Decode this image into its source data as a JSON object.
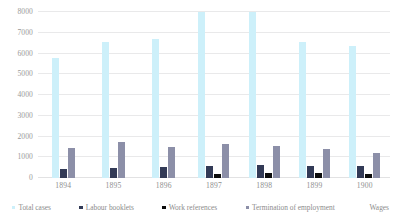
{
  "chart_data": {
    "type": "bar",
    "title": "",
    "subtitle": "",
    "xlabel": "",
    "ylabel": "",
    "ylim": [
      0,
      8000
    ],
    "ytick_step": 1000,
    "grid": true,
    "legend_position": "bottom",
    "categories": [
      "1894",
      "1895",
      "1896",
      "1897",
      "1898",
      "1899",
      "1900"
    ],
    "yticks": [
      "0",
      "1000",
      "2000",
      "3000",
      "4000",
      "5000",
      "6000",
      "7000",
      "8000"
    ],
    "series": [
      {
        "name": "Total cases",
        "color": "#cdf0fa",
        "values": [
          5800,
          6550,
          6700,
          8000,
          8000,
          6550,
          6350
        ]
      },
      {
        "name": "Labour booklets",
        "color": "#323a56",
        "values": [
          450,
          500,
          520,
          600,
          640,
          580,
          560
        ]
      },
      {
        "name": "Work references",
        "color": "#0b0b0b",
        "values": [
          0,
          0,
          0,
          180,
          230,
          220,
          210
        ]
      },
      {
        "name": "Termination of employment",
        "color": "#8c8fa8",
        "values": [
          1450,
          1750,
          1500,
          1620,
          1520,
          1400,
          1200
        ]
      },
      {
        "name": "Wages",
        "color": "#ffffff",
        "values": [
          0,
          0,
          0,
          0,
          0,
          0,
          0
        ]
      }
    ]
  },
  "legend": {
    "items": [
      {
        "label": "Total cases",
        "key": "total"
      },
      {
        "label": "Labour booklets",
        "key": "booklets"
      },
      {
        "label": "Work references",
        "key": "workref"
      },
      {
        "label": "Termination of employment",
        "key": "termination"
      },
      {
        "label": "Wages",
        "key": "wages"
      }
    ]
  }
}
